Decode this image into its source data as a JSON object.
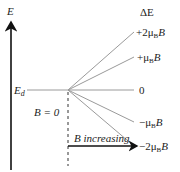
{
  "diagram": {
    "axis_label": "E",
    "level_label": "E",
    "level_subscript": "d",
    "delta_label": "ΔE",
    "field_zero_label": "B = 0",
    "field_arrow_label": "B increasing",
    "levels": [
      {
        "sign": "+2μ",
        "sub": "B",
        "suffix": "B",
        "y_end": 32
      },
      {
        "sign": "+μ",
        "sub": "B",
        "suffix": "B",
        "y_end": 57
      },
      {
        "sign": "0",
        "sub": "",
        "suffix": "",
        "y_end": 90
      },
      {
        "sign": "−μ",
        "sub": "B",
        "suffix": "B",
        "y_end": 122
      },
      {
        "sign": "−2μ",
        "sub": "B",
        "suffix": "B",
        "y_end": 146
      }
    ],
    "colors": {
      "axis": "#111111",
      "lines": "#9a9a9a",
      "text": "#222222"
    }
  }
}
